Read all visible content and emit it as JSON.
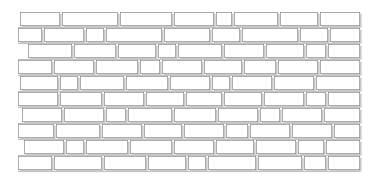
{
  "figure": {
    "width": 375,
    "height": 184
  },
  "style": {
    "background_color": "#ffffff",
    "brick_fill": "#ffffff",
    "outline_color": "#8a8a8a",
    "shadow_color": "#c9c9c9",
    "stroke_width": 0.7
  },
  "wall": {
    "bond_pattern": "running bond",
    "course_count": 10,
    "left_margin": 18,
    "right_edge": 360,
    "shadow_offset_x": 1.6,
    "shadow_offset_y": 1.6
  },
  "chart_data": {
    "type": "table",
    "xlabel": "horizontal position (px)",
    "ylabel": "course top (px)",
    "categories": [
      "course-1",
      "course-2",
      "course-3",
      "course-4",
      "course-5",
      "course-6",
      "course-7",
      "course-8",
      "course-9",
      "course-10"
    ],
    "courses": [
      {
        "index": 1,
        "top": 12,
        "height": 14,
        "bricks": [
          {
            "x": 20,
            "w": 40
          },
          {
            "x": 62,
            "w": 56
          },
          {
            "x": 120,
            "w": 52
          },
          {
            "x": 174,
            "w": 40
          },
          {
            "x": 216,
            "w": 16
          },
          {
            "x": 234,
            "w": 44
          },
          {
            "x": 280,
            "w": 38
          },
          {
            "x": 320,
            "w": 40
          }
        ]
      },
      {
        "index": 2,
        "top": 28,
        "height": 14,
        "bricks": [
          {
            "x": 18,
            "w": 24
          },
          {
            "x": 44,
            "w": 40
          },
          {
            "x": 86,
            "w": 18
          },
          {
            "x": 106,
            "w": 56
          },
          {
            "x": 164,
            "w": 46
          },
          {
            "x": 212,
            "w": 28
          },
          {
            "x": 242,
            "w": 56
          },
          {
            "x": 300,
            "w": 28
          },
          {
            "x": 330,
            "w": 30
          }
        ]
      },
      {
        "index": 3,
        "top": 44,
        "height": 14,
        "bricks": [
          {
            "x": 28,
            "w": 44
          },
          {
            "x": 74,
            "w": 42
          },
          {
            "x": 118,
            "w": 38
          },
          {
            "x": 158,
            "w": 18
          },
          {
            "x": 178,
            "w": 44
          },
          {
            "x": 224,
            "w": 40
          },
          {
            "x": 266,
            "w": 38
          },
          {
            "x": 306,
            "w": 20
          },
          {
            "x": 328,
            "w": 32
          }
        ]
      },
      {
        "index": 4,
        "top": 60,
        "height": 14,
        "bricks": [
          {
            "x": 18,
            "w": 34
          },
          {
            "x": 54,
            "w": 40
          },
          {
            "x": 96,
            "w": 42
          },
          {
            "x": 140,
            "w": 20
          },
          {
            "x": 162,
            "w": 40
          },
          {
            "x": 204,
            "w": 38
          },
          {
            "x": 244,
            "w": 32
          },
          {
            "x": 278,
            "w": 40
          },
          {
            "x": 320,
            "w": 40
          }
        ]
      },
      {
        "index": 5,
        "top": 76,
        "height": 14,
        "bricks": [
          {
            "x": 20,
            "w": 38
          },
          {
            "x": 60,
            "w": 18
          },
          {
            "x": 80,
            "w": 44
          },
          {
            "x": 126,
            "w": 42
          },
          {
            "x": 170,
            "w": 40
          },
          {
            "x": 212,
            "w": 18
          },
          {
            "x": 232,
            "w": 40
          },
          {
            "x": 274,
            "w": 40
          },
          {
            "x": 316,
            "w": 44
          }
        ]
      },
      {
        "index": 6,
        "top": 92,
        "height": 14,
        "bricks": [
          {
            "x": 18,
            "w": 40
          },
          {
            "x": 60,
            "w": 42
          },
          {
            "x": 104,
            "w": 40
          },
          {
            "x": 146,
            "w": 38
          },
          {
            "x": 186,
            "w": 36
          },
          {
            "x": 224,
            "w": 38
          },
          {
            "x": 264,
            "w": 40
          },
          {
            "x": 306,
            "w": 20
          },
          {
            "x": 328,
            "w": 32
          }
        ]
      },
      {
        "index": 7,
        "top": 108,
        "height": 14,
        "bricks": [
          {
            "x": 22,
            "w": 40
          },
          {
            "x": 64,
            "w": 40
          },
          {
            "x": 106,
            "w": 20
          },
          {
            "x": 128,
            "w": 44
          },
          {
            "x": 174,
            "w": 42
          },
          {
            "x": 218,
            "w": 40
          },
          {
            "x": 260,
            "w": 20
          },
          {
            "x": 282,
            "w": 40
          },
          {
            "x": 324,
            "w": 36
          }
        ]
      },
      {
        "index": 8,
        "top": 124,
        "height": 14,
        "bricks": [
          {
            "x": 18,
            "w": 36
          },
          {
            "x": 56,
            "w": 44
          },
          {
            "x": 102,
            "w": 40
          },
          {
            "x": 144,
            "w": 38
          },
          {
            "x": 184,
            "w": 40
          },
          {
            "x": 226,
            "w": 22
          },
          {
            "x": 250,
            "w": 40
          },
          {
            "x": 292,
            "w": 40
          },
          {
            "x": 334,
            "w": 26
          }
        ]
      },
      {
        "index": 9,
        "top": 140,
        "height": 14,
        "bricks": [
          {
            "x": 24,
            "w": 40
          },
          {
            "x": 66,
            "w": 18
          },
          {
            "x": 86,
            "w": 42
          },
          {
            "x": 130,
            "w": 42
          },
          {
            "x": 174,
            "w": 40
          },
          {
            "x": 216,
            "w": 38
          },
          {
            "x": 256,
            "w": 40
          },
          {
            "x": 298,
            "w": 26
          },
          {
            "x": 326,
            "w": 34
          }
        ]
      },
      {
        "index": 10,
        "top": 156,
        "height": 14,
        "bricks": [
          {
            "x": 18,
            "w": 34
          },
          {
            "x": 54,
            "w": 48
          },
          {
            "x": 104,
            "w": 42
          },
          {
            "x": 148,
            "w": 38
          },
          {
            "x": 188,
            "w": 18
          },
          {
            "x": 208,
            "w": 48
          },
          {
            "x": 258,
            "w": 44
          },
          {
            "x": 304,
            "w": 22
          },
          {
            "x": 328,
            "w": 32
          }
        ]
      }
    ]
  }
}
